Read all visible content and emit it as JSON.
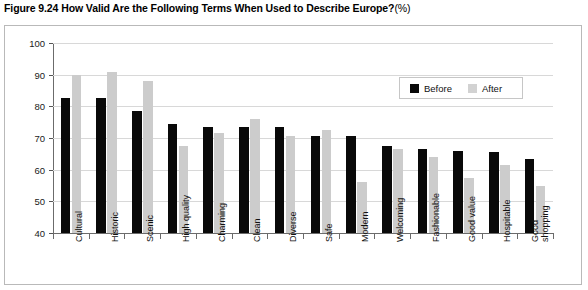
{
  "figure": {
    "title_main": "Figure 9.24  How Valid Are the Following Terms When Used to Describe Europe?",
    "title_unit": "(%)"
  },
  "legend": {
    "position": "top-right",
    "items": [
      {
        "label": "Before",
        "color": "#090909"
      },
      {
        "label": "After",
        "color": "#d2d2d2"
      }
    ]
  },
  "axis": {
    "y_ticks": [
      "100",
      "90",
      "80",
      "70",
      "60",
      "50",
      "40"
    ]
  },
  "chart_data": {
    "type": "bar",
    "xlabel": "",
    "ylabel": "",
    "ylim": [
      40,
      100
    ],
    "ytick_step": 10,
    "grid": true,
    "legend_position": "top-right",
    "categories": [
      "Cultural",
      "Historic",
      "Scenic",
      "High quality",
      "Charming",
      "Clean",
      "Diverse",
      "Safe",
      "Modern",
      "Welcoming",
      "Fashionable",
      "Good value",
      "Hospitable",
      "Good shopping"
    ],
    "series": [
      {
        "name": "Before",
        "color": "#090909",
        "values": [
          82.5,
          82.5,
          78.5,
          74.5,
          73.5,
          73.5,
          73.5,
          70.5,
          70.5,
          67.5,
          66.5,
          66,
          65.5,
          63.5
        ]
      },
      {
        "name": "After",
        "color": "#cccccc",
        "values": [
          90,
          91,
          88,
          67.5,
          71.5,
          76,
          70.5,
          72.5,
          56,
          66.5,
          64,
          57.5,
          61.5,
          55
        ]
      }
    ]
  }
}
